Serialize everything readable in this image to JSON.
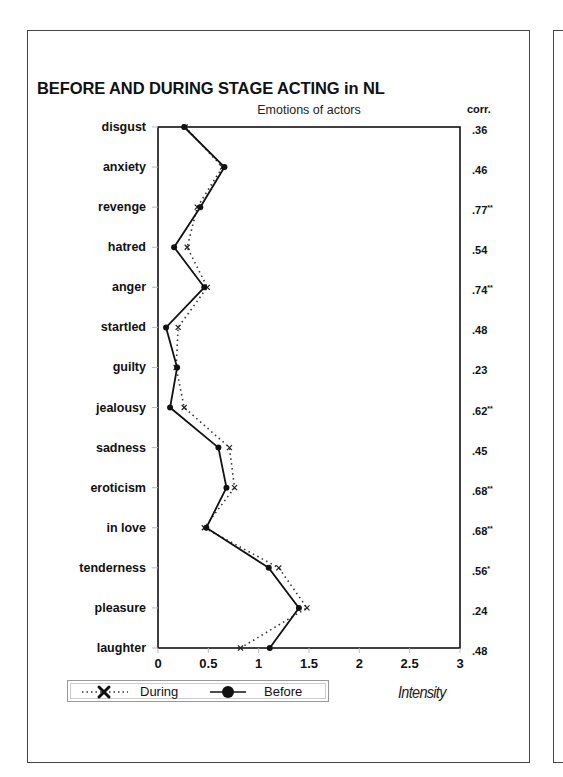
{
  "chart_data": {
    "type": "line",
    "title": "BEFORE AND DURING STAGE ACTING in NL",
    "subtitle": "Emotions of actors",
    "xlabel": "Intensity",
    "ylabel": "",
    "xlim": [
      0,
      3
    ],
    "x_ticks": [
      "0",
      "0.5",
      "1",
      "1.5",
      "2",
      "2.5",
      "3"
    ],
    "orientation": "horizontal-profile",
    "grid": false,
    "legend_position": "bottom-left",
    "categories": [
      "disgust",
      "anxiety",
      "revenge",
      "hatred",
      "anger",
      "startled",
      "guilty",
      "jealousy",
      "sadness",
      "eroticism",
      "in love",
      "tenderness",
      "pleasure",
      "laughter"
    ],
    "series": [
      {
        "name": "During",
        "style": "dotted",
        "marker": "x",
        "values": [
          0.27,
          0.64,
          0.39,
          0.29,
          0.49,
          0.2,
          0.18,
          0.26,
          0.71,
          0.76,
          0.46,
          1.2,
          1.48,
          0.82
        ]
      },
      {
        "name": "Before",
        "style": "solid",
        "marker": "dot",
        "values": [
          0.26,
          0.66,
          0.42,
          0.16,
          0.46,
          0.08,
          0.19,
          0.12,
          0.6,
          0.68,
          0.48,
          1.1,
          1.4,
          1.11
        ]
      }
    ],
    "correlation_header": "corr.",
    "correlations": [
      ".36",
      ".46",
      ".77**",
      ".54",
      ".74**",
      ".48",
      ".23",
      ".62**",
      ".45",
      ".68**",
      ".68**",
      ".56*",
      ".24",
      ".48"
    ]
  },
  "legend": {
    "during_label": "During",
    "before_label": "Before"
  }
}
